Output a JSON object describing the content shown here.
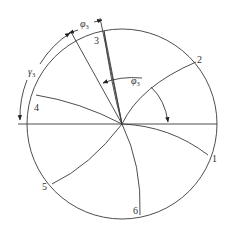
{
  "diagram": {
    "colors": {
      "line": "#3a3a3a",
      "text": "#333333",
      "background": "#ffffff"
    },
    "point_labels": [
      "1",
      "2",
      "3",
      "4",
      "5",
      "6"
    ],
    "angle_labels": {
      "phi3_top": "φ",
      "phi3_top_sub": "3",
      "phi3_mid": "φ",
      "phi3_mid_sub": "3",
      "gamma3": "γ",
      "gamma3_sub": "3"
    }
  }
}
